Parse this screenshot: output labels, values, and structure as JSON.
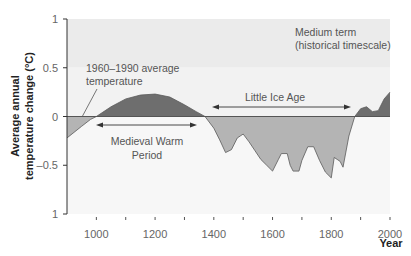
{
  "chart_data": {
    "type": "area",
    "title": "",
    "xlabel": "Year",
    "ylabel": "Average annual temperature change (°C)",
    "xlim": [
      900,
      2000
    ],
    "ylim": [
      -1,
      1
    ],
    "x_ticks": [
      1000,
      1200,
      1400,
      1600,
      1800,
      2000
    ],
    "y_ticks": [
      {
        "value": 1,
        "label": "1"
      },
      {
        "value": 0.5,
        "label": "0.5"
      },
      {
        "value": 0,
        "label": "0"
      },
      {
        "value": -0.5,
        "label": "–0.5"
      },
      {
        "value": -1,
        "label": "1"
      }
    ],
    "grid": false,
    "baseline": {
      "value": 0,
      "label": "1960–1990 average temperature"
    },
    "series": [
      {
        "name": "Temperature anomaly",
        "x": [
          900,
          950,
          980,
          1000,
          1050,
          1100,
          1150,
          1200,
          1250,
          1300,
          1340,
          1370,
          1400,
          1420,
          1440,
          1460,
          1480,
          1490,
          1500,
          1520,
          1540,
          1560,
          1580,
          1600,
          1620,
          1630,
          1650,
          1660,
          1670,
          1690,
          1700,
          1720,
          1740,
          1760,
          1780,
          1800,
          1810,
          1820,
          1830,
          1840,
          1860,
          1880,
          1900,
          1920,
          1940,
          1960,
          1980,
          2000
        ],
        "values": [
          -0.22,
          -0.1,
          -0.03,
          0,
          0.1,
          0.18,
          0.22,
          0.23,
          0.2,
          0.12,
          0.05,
          0,
          -0.12,
          -0.24,
          -0.37,
          -0.34,
          -0.22,
          -0.2,
          -0.18,
          -0.26,
          -0.35,
          -0.44,
          -0.5,
          -0.56,
          -0.44,
          -0.38,
          -0.38,
          -0.5,
          -0.56,
          -0.56,
          -0.45,
          -0.31,
          -0.31,
          -0.45,
          -0.57,
          -0.63,
          -0.42,
          -0.44,
          -0.46,
          -0.52,
          -0.2,
          0,
          0.08,
          0.1,
          0.05,
          0.06,
          0.18,
          0.25
        ]
      }
    ],
    "annotations": [
      {
        "text": "1960–1990 average temperature",
        "target": "baseline"
      },
      {
        "text": "Medieval Warm Period",
        "span": [
          1000,
          1370
        ]
      },
      {
        "text": "Little Ice Age",
        "span": [
          1400,
          1900
        ]
      },
      {
        "text": "Medium term (historical timescale)",
        "position": "top-right"
      }
    ],
    "colors": {
      "above": "#6e6e6e",
      "below": "#b4b4b4",
      "band_top": "#ebebeb",
      "band_mid": "#f2f2f2",
      "band_low": "#f7f7f7"
    }
  },
  "labels": {
    "ylabel_line1": "Average annual",
    "ylabel_line2": "temperature change (°C)",
    "xlabel": "Year",
    "baseline_line1": "1960–1990 average",
    "baseline_line2": "temperature",
    "mwp_line1": "Medieval Warm",
    "mwp_line2": "Period",
    "lia": "Little Ice Age",
    "term_line1": "Medium term",
    "term_line2": "(historical timescale)"
  }
}
